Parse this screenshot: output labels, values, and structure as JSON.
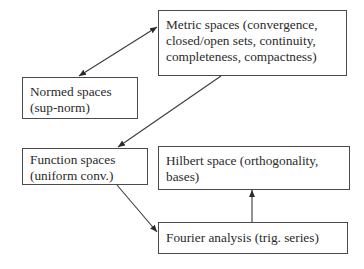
{
  "diagram": {
    "nodes": [
      {
        "id": "metric",
        "lines": [
          "Metric spaces (convergence,",
          "closed/open sets, continuity,",
          "completeness, compactness)"
        ]
      },
      {
        "id": "normed",
        "lines": [
          "Normed spaces",
          "(sup-norm)"
        ]
      },
      {
        "id": "function",
        "lines": [
          "Function spaces",
          "(uniform conv.)"
        ]
      },
      {
        "id": "hilbert",
        "lines": [
          "Hilbert space (orthogonality,",
          "bases)"
        ]
      },
      {
        "id": "fourier",
        "lines": [
          "Fourier analysis (trig. series)"
        ]
      }
    ],
    "edges": [
      {
        "from": "normed",
        "to": "metric",
        "type": "bidirectional"
      },
      {
        "from": "metric",
        "to": "function",
        "type": "directed"
      },
      {
        "from": "function",
        "to": "fourier",
        "type": "directed"
      },
      {
        "from": "fourier",
        "to": "hilbert",
        "type": "directed"
      }
    ],
    "colors": {
      "stroke": "#3a3a3a",
      "text": "#2a2a2a",
      "background": "#ffffff"
    }
  }
}
